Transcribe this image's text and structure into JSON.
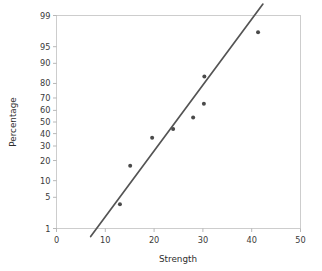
{
  "chart_data": {
    "type": "scatter",
    "title": "",
    "subtitle": "",
    "xlabel": "Strength",
    "ylabel": "Percentage",
    "xlim": [
      0,
      50
    ],
    "ylim": [
      1,
      99
    ],
    "yscale": "normal-probability",
    "grid": false,
    "legend": null,
    "xticks": [
      0,
      10,
      20,
      30,
      40,
      50
    ],
    "xticklabels": [
      "0",
      "10",
      "20",
      "30",
      "40",
      "50"
    ],
    "yticks": [
      1,
      5,
      10,
      20,
      30,
      40,
      50,
      60,
      70,
      80,
      90,
      95,
      99
    ],
    "yticklabels": [
      "1",
      "5",
      "10",
      "20",
      "30",
      "40",
      "50",
      "60",
      "70",
      "80",
      "90",
      "95",
      "99"
    ],
    "series": [
      {
        "name": "data",
        "type": "scatter",
        "marker": "circle",
        "color": "#4a4a4a",
        "x": [
          13.0,
          15.1,
          19.6,
          23.9,
          28.0,
          30.2,
          30.3,
          41.3
        ],
        "y": [
          3.6,
          17.0,
          36.5,
          44.0,
          54.0,
          65.5,
          84.0,
          97.5
        ]
      },
      {
        "name": "fit-line",
        "type": "line",
        "color": "#545454",
        "x": [
          7.0,
          42.3
        ],
        "y": [
          0.62,
          99.5
        ]
      }
    ]
  },
  "axes": {
    "x_title": "Strength",
    "y_title": "Percentage"
  }
}
